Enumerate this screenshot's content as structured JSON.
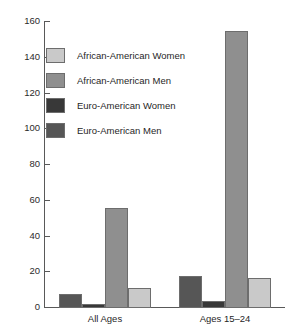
{
  "chart_data": {
    "type": "bar",
    "title": "",
    "subtitle": "",
    "xlabel": "",
    "ylabel": "",
    "categories": [
      "All Ages",
      "Ages 15–24"
    ],
    "ylim": [
      0,
      160
    ],
    "yticks": [
      0,
      20,
      40,
      60,
      80,
      100,
      120,
      140,
      160
    ],
    "ytick_labels": [
      "0",
      "20",
      "40",
      "60",
      "80",
      "100",
      "120",
      "140",
      "160"
    ],
    "grid": false,
    "legend_position": "upper-left",
    "series": [
      {
        "name": "African-American Women",
        "color": "#c9c9c9",
        "draw_order": 4,
        "values": [
          11,
          17
        ]
      },
      {
        "name": "African-American Men",
        "color": "#8f8f8f",
        "draw_order": 3,
        "values": [
          56,
          155
        ]
      },
      {
        "name": "Euro-American Women",
        "color": "#383838",
        "draw_order": 2,
        "values": [
          2,
          4
        ]
      },
      {
        "name": "Euro-American Men",
        "color": "#565656",
        "draw_order": 1,
        "values": [
          8,
          18
        ]
      }
    ]
  },
  "legend": {
    "items": [
      {
        "label": "African-American Women",
        "color": "#c9c9c9"
      },
      {
        "label": "African-American Men",
        "color": "#8f8f8f"
      },
      {
        "label": "Euro-American Women",
        "color": "#383838"
      },
      {
        "label": "Euro-American Men",
        "color": "#565656"
      }
    ]
  },
  "axis": {
    "line_color": "#595959"
  }
}
